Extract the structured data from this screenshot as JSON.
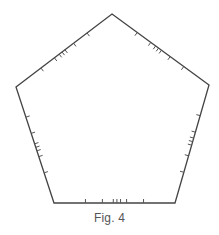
{
  "figure": {
    "caption": "Fig. 4",
    "shape": "pentagon",
    "stroke_color": "#444444",
    "tick_color": "#555555",
    "stroke_width": 1.3,
    "tick_length": 4,
    "vertices": [
      [
        112,
        14
      ],
      [
        209,
        85
      ],
      [
        175,
        203
      ],
      [
        54,
        203
      ],
      [
        16,
        87
      ]
    ],
    "tick_fractions": [
      0.26,
      0.4,
      0.45,
      0.48,
      0.51,
      0.6,
      0.74
    ],
    "ticks_point": "inward",
    "ticks_per_edge": 7
  }
}
